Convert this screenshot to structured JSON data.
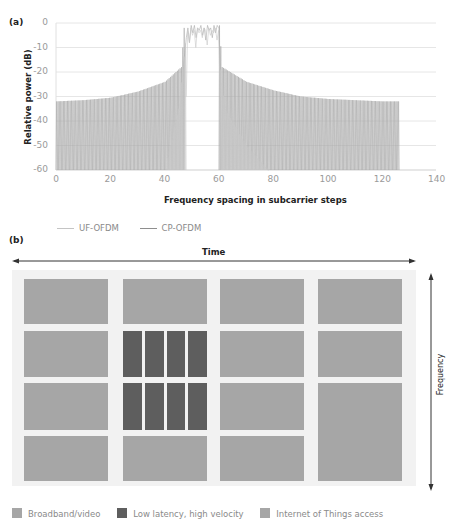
{
  "header": {
    "cropped_text": ""
  },
  "panel_a": {
    "label": "(a)",
    "y_axis_title": "Relative power (dB)",
    "x_axis_title": "Frequency spacing in subcarrier steps",
    "y_ticks": [
      "0",
      "-10",
      "-20",
      "-30",
      "-40",
      "-50",
      "-60"
    ],
    "x_ticks": [
      "0",
      "20",
      "40",
      "60",
      "80",
      "100",
      "120",
      "140"
    ],
    "legend": [
      {
        "label": "UF-OFDM",
        "color": "#c4c4c4"
      },
      {
        "label": "CP-OFDM",
        "color": "#8e8e8e"
      }
    ]
  },
  "panel_b": {
    "label": "(b)",
    "time_label": "Time",
    "frequency_label": "Frequency",
    "legend": [
      {
        "label": "Broadband/video",
        "color": "#a6a6a6"
      },
      {
        "label": "Low latency, high velocity",
        "color": "#5e5e5e"
      },
      {
        "label": "Internet of Things access",
        "color": "#a6a6a6"
      }
    ]
  },
  "chart_data": [
    {
      "type": "line",
      "title": "",
      "xlabel": "Frequency spacing in subcarrier steps",
      "ylabel": "Relative power (dB)",
      "xlim": [
        0,
        140
      ],
      "ylim": [
        -60,
        0
      ],
      "grid": "horizontal",
      "legend_position": "bottom-left",
      "series": [
        {
          "name": "UF-OFDM",
          "description": "Occupied band ~48–60 near 0 dB; sidelobes fall steeply to below -60 dB outside band (~41–47 and ~60–78)",
          "x": [
            40,
            45,
            48,
            50,
            55,
            59,
            62,
            70,
            78
          ],
          "y": [
            -60,
            -35,
            -3,
            -2,
            -3,
            -3,
            -35,
            -50,
            -60
          ]
        },
        {
          "name": "CP-OFDM",
          "description": "Occupied band ~47–60 near 0 dB; sidelobe envelope decays slowly from ~-17 dB at edges to ~-32 dB at 0 and 126",
          "x": [
            0,
            10,
            20,
            30,
            40,
            46,
            47,
            50,
            55,
            60,
            61,
            70,
            80,
            90,
            100,
            110,
            120,
            126
          ],
          "y": [
            -32,
            -31.5,
            -30.5,
            -28,
            -24,
            -18,
            -2,
            0,
            -1,
            -1,
            -18,
            -24,
            -27.5,
            -30,
            -31,
            -31.5,
            -32,
            -32
          ]
        }
      ]
    },
    {
      "type": "table",
      "title": "Time-frequency resource allocation",
      "xlabel": "Time",
      "ylabel": "Frequency",
      "columns": 4,
      "rows": 4,
      "allocation": [
        [
          "Broadband/video",
          "Broadband/video",
          "Broadband/video",
          "Broadband/video"
        ],
        [
          "Broadband/video",
          "Low latency, high velocity (4 slots)",
          "Broadband/video",
          "Broadband/video"
        ],
        [
          "Broadband/video",
          "Low latency, high velocity (4 slots)",
          "Broadband/video",
          "Internet of Things access (merged rows 3-4)"
        ],
        [
          "Broadband/video",
          "Broadband/video",
          "Broadband/video",
          "Internet of Things access (merged rows 3-4)"
        ]
      ]
    }
  ]
}
